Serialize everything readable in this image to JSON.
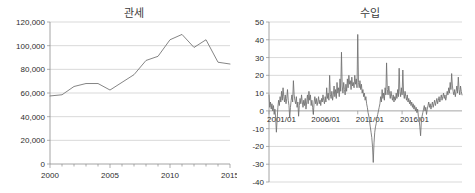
{
  "figure": {
    "background": "#ffffff",
    "line_color": "#6f6f6f",
    "grid_color": "#c9c9c9",
    "axis_color": "#8d8d8d"
  },
  "charts": {
    "left": {
      "title": "관세",
      "ylabels": [
        "120,000",
        "100,000",
        "80,000",
        "60,000",
        "40,000",
        "20,000",
        "0"
      ],
      "xlabels": [
        "2000",
        "2005",
        "2010",
        "2015"
      ]
    },
    "right": {
      "title": "수입",
      "ylabels": [
        "50",
        "40",
        "30",
        "20",
        "10",
        "0",
        "-10",
        "-20",
        "-30",
        "-40"
      ],
      "xlabels": [
        "2001/01",
        "2006/01",
        "2011/01",
        "2016/01"
      ]
    }
  },
  "chart_data": [
    {
      "type": "line",
      "id": "customs-duty",
      "title": "관세",
      "xlabel": "",
      "ylabel": "",
      "xlim": [
        2000,
        2015
      ],
      "ylim": [
        0,
        120000
      ],
      "yticks": [
        0,
        20000,
        40000,
        60000,
        80000,
        100000,
        120000
      ],
      "xticks": [
        2000,
        2005,
        2010,
        2015
      ],
      "grid": true,
      "legend": "none",
      "x": [
        2000,
        2001,
        2002,
        2003,
        2004,
        2005,
        2006,
        2007,
        2008,
        2009,
        2010,
        2011,
        2012,
        2013,
        2014,
        2015
      ],
      "values": [
        57500,
        58500,
        65500,
        68000,
        68000,
        62500,
        69000,
        75500,
        87500,
        91000,
        105000,
        109500,
        98500,
        105000,
        86000,
        84500
      ],
      "series": [
        {
          "name": "관세",
          "values": [
            57500,
            58500,
            65500,
            68000,
            68000,
            62500,
            69000,
            75500,
            87500,
            91000,
            105000,
            109500,
            98500,
            105000,
            86000,
            84500
          ]
        }
      ]
    },
    {
      "type": "line",
      "id": "imports-growth",
      "title": "수입",
      "xlabel": "",
      "ylabel": "",
      "xlim": [
        "2001/01",
        "2017/12"
      ],
      "ylim": [
        -40,
        50
      ],
      "yticks": [
        -40,
        -30,
        -20,
        -10,
        0,
        10,
        20,
        30,
        40,
        50
      ],
      "xticks": [
        "2001/01",
        "2006/01",
        "2011/01",
        "2016/01"
      ],
      "grid": true,
      "legend": "none",
      "x_start": "2001/01",
      "x_end": "2017/12",
      "frequency": "monthly",
      "values": [
        9,
        2,
        5,
        1,
        4,
        0,
        3,
        -2,
        1,
        -4,
        -12,
        -5,
        2,
        6,
        3,
        8,
        5,
        11,
        6,
        13,
        8,
        5,
        9,
        4,
        7,
        12,
        6,
        3,
        -4,
        2,
        6,
        9,
        5,
        17,
        9,
        6,
        4,
        8,
        2,
        5,
        -3,
        3,
        7,
        4,
        9,
        5,
        2,
        6,
        3,
        7,
        1,
        5,
        9,
        4,
        11,
        6,
        9,
        3,
        6,
        2,
        -2,
        5,
        8,
        4,
        7,
        3,
        5,
        8,
        4,
        6,
        3,
        7,
        5,
        9,
        6,
        4,
        8,
        5,
        13,
        7,
        10,
        6,
        20,
        9,
        7,
        11,
        6,
        9,
        14,
        8,
        12,
        7,
        16,
        10,
        13,
        8,
        18,
        11,
        33,
        14,
        10,
        16,
        12,
        9,
        15,
        11,
        18,
        13,
        20,
        15,
        17,
        12,
        19,
        14,
        16,
        13,
        20,
        15,
        18,
        13,
        43,
        16,
        13,
        17,
        12,
        15,
        10,
        12,
        8,
        10,
        6,
        8,
        4,
        2,
        -1,
        -3,
        -6,
        -9,
        -12,
        -15,
        -20,
        -29,
        -18,
        -12,
        -9,
        -7,
        -4,
        -2,
        0,
        2,
        4,
        8,
        5,
        12,
        7,
        10,
        6,
        13,
        9,
        27,
        12,
        9,
        14,
        10,
        7,
        11,
        8,
        6,
        9,
        5,
        8,
        6,
        10,
        7,
        12,
        8,
        24,
        11,
        8,
        13,
        9,
        23,
        10,
        7,
        11,
        8,
        6,
        9,
        5,
        7,
        4,
        6,
        3,
        5,
        2,
        4,
        1,
        3,
        0,
        2,
        -1,
        1,
        -3,
        -5,
        -9,
        -14,
        -6,
        -3,
        -1,
        1,
        3,
        0,
        2,
        -2,
        1,
        3,
        5,
        2,
        4,
        1,
        3,
        5,
        2,
        4,
        6,
        3,
        5,
        7,
        4,
        6,
        8,
        5,
        7,
        9,
        6,
        8,
        10,
        7,
        9,
        6,
        8,
        11,
        9,
        13,
        10,
        16,
        12,
        21,
        14,
        11,
        9,
        12,
        8,
        11,
        14,
        10,
        19,
        12,
        9,
        14,
        11,
        9
      ]
    }
  ]
}
